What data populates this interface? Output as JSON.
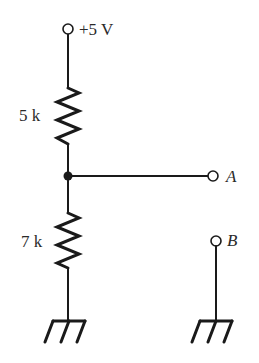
{
  "diagram": {
    "type": "voltage-divider-circuit",
    "supply": {
      "label": "+5 V"
    },
    "resistors": [
      {
        "label": "5 k"
      },
      {
        "label": "7 k"
      }
    ],
    "terminals": [
      {
        "label": "A"
      },
      {
        "label": "B"
      }
    ],
    "colors": {
      "line": "#1a1a1a",
      "text": "#2a2a2a",
      "background": "#ffffff"
    }
  }
}
